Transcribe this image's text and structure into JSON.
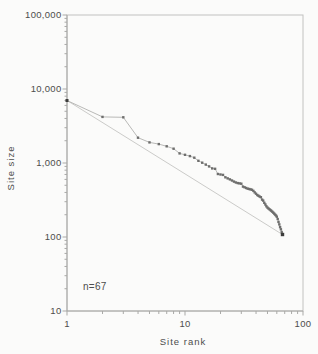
{
  "figure": {
    "background": "#fbfbfa",
    "frame_color": "#c2c2c0",
    "axis_color": "#a8a8a6",
    "tick_color": "#a9a9a7",
    "label_color": "#4d4d4c",
    "data_marker_color": "#6e6e6d",
    "data_line_color": "#b1b1af",
    "reference_line_color": "#cbcbc9",
    "endpoint_color": "#3c3c3b"
  },
  "chart_data": {
    "type": "line",
    "title": "",
    "xlabel": "Site rank",
    "ylabel": "Site size",
    "x_scale": "log",
    "y_scale": "log",
    "xlim": [
      1,
      100
    ],
    "ylim": [
      10,
      100000
    ],
    "x_tick_values": [
      1,
      10,
      100
    ],
    "x_tick_labels": [
      "1",
      "10",
      "100"
    ],
    "y_tick_values": [
      100000,
      10000,
      1000,
      100,
      10
    ],
    "y_tick_labels": [
      "100,000",
      "10,000",
      "1,000",
      "100",
      "10"
    ],
    "grid": false,
    "legend": "none",
    "annotation": "n=67",
    "n": 67,
    "series": [
      {
        "name": "site size by rank",
        "marker": "square",
        "rank_start": 1,
        "values": [
          7000,
          4200,
          4150,
          2200,
          1900,
          1800,
          1680,
          1560,
          1350,
          1290,
          1240,
          1180,
          1070,
          1010,
          950,
          900,
          845,
          835,
          710,
          700,
          690,
          640,
          620,
          600,
          580,
          560,
          545,
          535,
          530,
          525,
          480,
          470,
          460,
          450,
          445,
          440,
          435,
          420,
          400,
          385,
          370,
          360,
          352,
          345,
          320,
          310,
          290,
          275,
          260,
          250,
          243,
          237,
          231,
          225,
          219,
          213,
          207,
          201,
          195,
          188,
          175,
          160,
          148,
          136,
          127,
          117,
          108
        ]
      }
    ],
    "reference_line": {
      "type": "segment",
      "x1": 1,
      "y1": 7000,
      "x2": 67,
      "y2": 108
    }
  }
}
